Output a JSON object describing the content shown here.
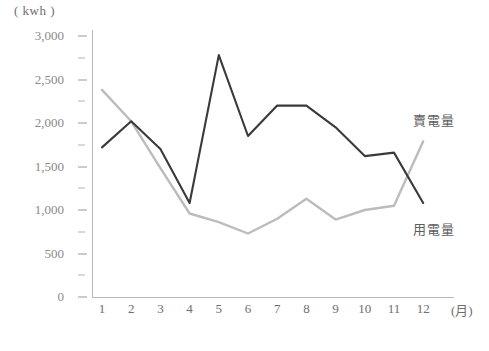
{
  "chart_data": {
    "type": "line",
    "title": "",
    "xlabel": "(月)",
    "ylabel": "( kwh )",
    "categories": [
      "1",
      "2",
      "3",
      "4",
      "5",
      "6",
      "7",
      "8",
      "9",
      "10",
      "11",
      "12"
    ],
    "ylim": [
      0,
      3000
    ],
    "ytick_step": 500,
    "yminor_step": 250,
    "grid": false,
    "legend_position": "inline-right",
    "series": [
      {
        "name": "賣電量",
        "color": "#3a3a3a",
        "values": [
          1720,
          2020,
          1700,
          1080,
          2780,
          1850,
          2200,
          2200,
          1950,
          1620,
          1660,
          1080
        ]
      },
      {
        "name": "用電量",
        "color": "#bcbcbc",
        "values": [
          2380,
          2020,
          1480,
          960,
          860,
          730,
          900,
          1130,
          890,
          1000,
          1050,
          1790
        ]
      }
    ],
    "ytick_labels": [
      "3,000",
      "2,500",
      "2,000",
      "1,500",
      "1,000",
      "500",
      "0"
    ],
    "ytick_values": [
      3000,
      2500,
      2000,
      1500,
      1000,
      500,
      0
    ]
  },
  "axis": {
    "unit_label": "( kwh )",
    "month_axis_label": "(月)"
  }
}
